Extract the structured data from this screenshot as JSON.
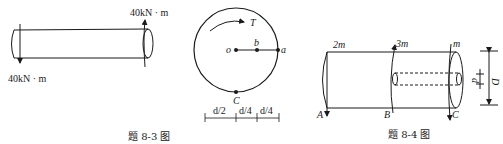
{
  "figures": [
    {
      "id": "8-3-left",
      "description": "Solid shaft with opposite end torques",
      "labels": {
        "torque_right": "40kN · m",
        "torque_left": "40kN · m"
      }
    },
    {
      "id": "8-3-right",
      "description": "Cross-section with torque T and points o, b, a, C",
      "labels": {
        "torque": "T",
        "point_o": "o",
        "point_b": "b",
        "point_a": "a",
        "point_c": "C",
        "dim_1": "d/2",
        "dim_2": "d/4",
        "dim_3": "d/4"
      }
    },
    {
      "id": "8-4",
      "description": "Hollow-section shaft with three torques",
      "labels": {
        "torque_a": "2m",
        "torque_b": "3m",
        "torque_c": "m",
        "point_a": "A",
        "point_b": "B",
        "point_c": "C",
        "inner_d": "d",
        "outer_d": "D"
      }
    }
  ],
  "captions": {
    "fig_8_3": "题 8-3 图",
    "fig_8_4": "题 8-4 图"
  }
}
